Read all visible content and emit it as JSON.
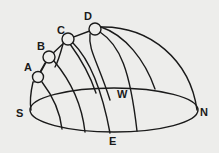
{
  "diagram": {
    "type": "celestial-sphere-sun-paths",
    "colors": {
      "background": "#ededeb",
      "stroke": "#1a1a1a"
    },
    "horizon_labels": {
      "south": "S",
      "north": "N",
      "east": "E",
      "west": "W"
    },
    "sun_positions": [
      {
        "label": "A"
      },
      {
        "label": "B"
      },
      {
        "label": "C"
      },
      {
        "label": "D"
      }
    ]
  }
}
